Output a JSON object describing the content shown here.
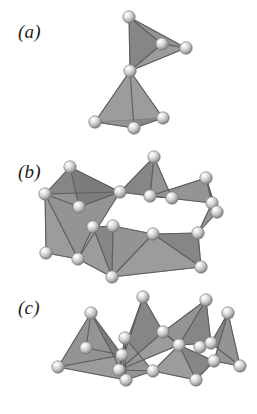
{
  "figure": {
    "background_color": "#ffffff",
    "width": 257,
    "height": 414
  },
  "labels": {
    "a": "(a)",
    "b": "(b)",
    "c": "(c)"
  },
  "panels": [
    {
      "id": "a",
      "label": "(a)",
      "caption_text": "(a)",
      "motif": "double tetrahedron sharing one corner vertex",
      "tetrahedra_count": 2,
      "sphere_count": 7
    },
    {
      "id": "b",
      "label": "(b)",
      "caption_text": "(b)",
      "motif": "double chain of corner-sharing tetrahedra forming a ring",
      "tetrahedra_count": 8,
      "sphere_count": 18
    },
    {
      "id": "c",
      "label": "(c)",
      "caption_text": "(c)",
      "motif": "dense double chain of alternating apex-up tetrahedra",
      "tetrahedra_count": 8,
      "sphere_count": 18
    }
  ],
  "colors": {
    "face_light": "#9c9c9c",
    "face_mid": "#949494",
    "face_dark": "#868686",
    "face_darkest": "#7c7c7c",
    "edge": "#5e5e5e",
    "sphere_highlight": "#fcfcfc",
    "sphere_body": "#c9c9c9",
    "sphere_rim": "#7a7a7a",
    "label_color": "#1b1b1b",
    "background": "#ffffff"
  },
  "geometry": {
    "sphere_radius": 6.2,
    "panel_a": {
      "spheres": [
        [
          129,
          17
        ],
        [
          162,
          44
        ],
        [
          186,
          48
        ],
        [
          130,
          71
        ],
        [
          95,
          122
        ],
        [
          134,
          128
        ],
        [
          163,
          118
        ]
      ],
      "upper_tetra_faces": [
        {
          "pts": "129,17 162,44 130,71",
          "shade": "face_dark"
        },
        {
          "pts": "129,17 186,48 162,44",
          "shade": "face_mid"
        },
        {
          "pts": "162,44 186,48 130,71",
          "shade": "face_light"
        }
      ],
      "upper_edges": [
        "129,17 162,44",
        "129,17 186,48",
        "129,17 130,71",
        "162,44 186,48",
        "162,44 130,71",
        "186,48 130,71"
      ],
      "lower_tetra_faces": [
        {
          "pts": "130,71 95,122 134,128",
          "shade": "face_mid"
        },
        {
          "pts": "130,71 134,128 163,118",
          "shade": "face_dark"
        },
        {
          "pts": "130,71 95,122 163,118",
          "shade": "face_light"
        }
      ],
      "lower_edges": [
        "130,71 95,122",
        "130,71 134,128",
        "130,71 163,118",
        "95,122 134,128",
        "134,128 163,118"
      ]
    },
    "panel_b": {
      "spheres": [
        [
          70,
          167
        ],
        [
          154,
          157
        ],
        [
          45,
          194
        ],
        [
          79,
          207
        ],
        [
          120,
          192
        ],
        [
          172,
          198
        ],
        [
          212,
          203
        ],
        [
          206,
          178
        ],
        [
          113,
          226
        ],
        [
          46,
          253
        ],
        [
          93,
          227
        ],
        [
          153,
          234
        ],
        [
          217,
          212
        ],
        [
          112,
          277
        ],
        [
          201,
          267
        ],
        [
          78,
          259
        ],
        [
          198,
          233
        ],
        [
          150,
          196
        ]
      ],
      "faces": [
        {
          "pts": "45,194 70,167 120,192",
          "shade": "face_dark"
        },
        {
          "pts": "45,194 120,192 78,259",
          "shade": "face_mid"
        },
        {
          "pts": "45,194 78,259 46,253",
          "shade": "face_light"
        },
        {
          "pts": "70,167 79,207 120,192",
          "shade": "face_darkest"
        },
        {
          "pts": "120,192 154,157 150,196",
          "shade": "face_dark"
        },
        {
          "pts": "154,157 172,198 150,196",
          "shade": "face_mid"
        },
        {
          "pts": "150,196 172,198 206,178",
          "shade": "face_light"
        },
        {
          "pts": "206,178 212,203 217,212",
          "shade": "face_dark"
        },
        {
          "pts": "206,178 150,196 212,203",
          "shade": "face_mid"
        },
        {
          "pts": "93,227 113,226 112,277",
          "shade": "face_dark"
        },
        {
          "pts": "93,227 112,277 78,259",
          "shade": "face_light"
        },
        {
          "pts": "113,226 153,234 112,277",
          "shade": "face_mid"
        },
        {
          "pts": "153,234 198,233 201,267",
          "shade": "face_dark"
        },
        {
          "pts": "153,234 201,267 112,277",
          "shade": "face_light"
        },
        {
          "pts": "198,233 217,212 212,203",
          "shade": "face_mid"
        }
      ],
      "edges": [
        "45,194 70,167",
        "70,167 120,192",
        "45,194 120,192",
        "45,194 46,253",
        "46,253 78,259",
        "45,194 78,259",
        "70,167 79,207",
        "79,207 120,192",
        "120,192 78,259",
        "120,192 154,157",
        "154,157 150,196",
        "120,192 150,196",
        "154,157 172,198",
        "150,196 172,198",
        "150,196 206,178",
        "206,178 212,203",
        "212,203 217,212",
        "206,178 217,212",
        "150,196 212,203",
        "93,227 113,226",
        "93,227 78,259",
        "113,226 112,277",
        "93,227 112,277",
        "78,259 112,277",
        "113,226 153,234",
        "153,234 112,277",
        "153,234 198,233",
        "198,233 201,267",
        "153,234 201,267",
        "112,277 201,267",
        "198,233 217,212",
        "198,233 212,203",
        "79,207 45,194"
      ]
    },
    "panel_c": {
      "spheres": [
        [
          91,
          313
        ],
        [
          143,
          297
        ],
        [
          163,
          332
        ],
        [
          206,
          300
        ],
        [
          58,
          367
        ],
        [
          125,
          338
        ],
        [
          200,
          347
        ],
        [
          228,
          313
        ],
        [
          126,
          380
        ],
        [
          196,
          380
        ],
        [
          240,
          366
        ],
        [
          122,
          355
        ],
        [
          179,
          345
        ],
        [
          211,
          343
        ],
        [
          119,
          370
        ],
        [
          214,
          361
        ],
        [
          86,
          348
        ],
        [
          153,
          371
        ]
      ],
      "faces": [
        {
          "pts": "91,313 58,367 122,355",
          "shade": "face_mid"
        },
        {
          "pts": "91,313 122,355 126,380",
          "shade": "face_darkest"
        },
        {
          "pts": "143,297 119,370 163,332",
          "shade": "face_dark"
        },
        {
          "pts": "143,297 122,355 119,370",
          "shade": "face_mid"
        },
        {
          "pts": "163,332 119,370 179,345",
          "shade": "face_light"
        },
        {
          "pts": "125,338 119,370 153,371",
          "shade": "face_dark"
        },
        {
          "pts": "125,338 153,371 126,380",
          "shade": "face_mid"
        },
        {
          "pts": "206,300 179,345 211,343",
          "shade": "face_dark"
        },
        {
          "pts": "206,300 163,332 179,345",
          "shade": "face_mid"
        },
        {
          "pts": "228,313 211,343 240,366",
          "shade": "face_dark"
        },
        {
          "pts": "228,313 214,361 240,366",
          "shade": "face_mid"
        },
        {
          "pts": "179,345 153,371 196,380",
          "shade": "face_light"
        },
        {
          "pts": "179,345 196,380 214,361",
          "shade": "face_dark"
        },
        {
          "pts": "58,367 122,355 126,380",
          "shade": "face_light"
        }
      ],
      "edges": [
        "91,313 58,367",
        "91,313 122,355",
        "58,367 122,355",
        "91,313 126,380",
        "58,367 126,380",
        "122,355 126,380",
        "143,297 119,370",
        "143,297 163,332",
        "119,370 163,332",
        "143,297 122,355",
        "122,355 119,370",
        "163,332 179,345",
        "119,370 179,345",
        "125,338 119,370",
        "125,338 153,371",
        "119,370 153,371",
        "125,338 126,380",
        "126,380 153,371",
        "206,300 163,332",
        "206,300 179,345",
        "163,332 179,345",
        "206,300 211,343",
        "179,345 211,343",
        "228,313 211,343",
        "228,313 240,366",
        "211,343 240,366",
        "228,313 214,361",
        "214,361 240,366",
        "179,345 153,371",
        "153,371 196,380",
        "179,345 196,380",
        "196,380 214,361",
        "179,345 214,361",
        "86,348 91,313",
        "86,348 122,355"
      ]
    }
  }
}
